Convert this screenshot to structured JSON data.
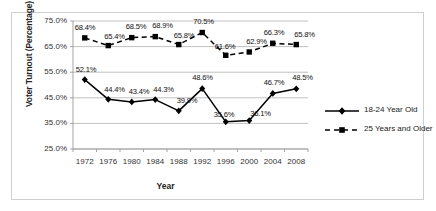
{
  "chart_data": {
    "type": "line",
    "title": "",
    "xlabel": "Year",
    "ylabel": "Voter Turnout (Percentage)",
    "categories": [
      1972,
      1976,
      1980,
      1984,
      1988,
      1992,
      1996,
      2000,
      2004,
      2008
    ],
    "xtick_labels": [
      "1972",
      "1976",
      "1980",
      "1984",
      "1988",
      "1992",
      "1996",
      "2000",
      "2004",
      "2008"
    ],
    "ylim": [
      25.0,
      75.0
    ],
    "ytick_labels": [
      "75.0%",
      "65.0%",
      "55.0%",
      "45.0%",
      "35.0%",
      "25.0%"
    ],
    "yticks": [
      75.0,
      65.0,
      55.0,
      45.0,
      35.0,
      25.0
    ],
    "grid": true,
    "legend_position": "right",
    "series": [
      {
        "name": "18-24 Year Old",
        "marker": "diamond",
        "linestyle": "solid",
        "color": "#000000",
        "values": [
          52.1,
          44.4,
          43.4,
          44.3,
          39.9,
          48.6,
          35.6,
          36.1,
          46.7,
          48.5
        ],
        "labels": [
          "52.1%",
          "44.4%",
          "43.4%",
          "44.3%",
          "39.9%",
          "48.6%",
          "35.6%",
          "36.1%",
          "46.7%",
          "48.5%"
        ]
      },
      {
        "name": "25 Years and Older",
        "marker": "square",
        "linestyle": "dashed",
        "color": "#000000",
        "values": [
          68.4,
          65.4,
          68.5,
          68.9,
          65.8,
          70.5,
          61.6,
          62.9,
          66.3,
          65.8
        ],
        "labels": [
          "68.4%",
          "65.4%",
          "68.5%",
          "68.9%",
          "65.8%",
          "70.5%",
          "61.6%",
          "62.9%",
          "66.3%",
          "65.8%"
        ]
      }
    ]
  },
  "legend": {
    "items": [
      {
        "label": "18-24 Year Old"
      },
      {
        "label": "25 Years and Older"
      }
    ]
  },
  "axes": {
    "y_title": "Voter Turnout (Percentage)",
    "x_title": "Year"
  }
}
